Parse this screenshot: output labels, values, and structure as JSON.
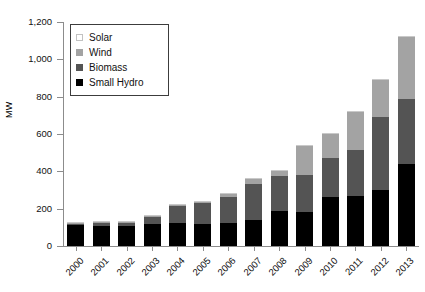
{
  "chart_data": {
    "type": "bar",
    "stacked": true,
    "title": "",
    "xlabel": "",
    "ylabel": "MW",
    "ylim": [
      0,
      1200
    ],
    "yticks": [
      0,
      200,
      400,
      600,
      800,
      1000,
      1200
    ],
    "ytick_labels": [
      "0",
      "200",
      "400",
      "600",
      "800",
      "1,000",
      "1,200"
    ],
    "grid": false,
    "legend_position": "top-left",
    "categories": [
      "2000",
      "2001",
      "2002",
      "2003",
      "2004",
      "2005",
      "2006",
      "2007",
      "2008",
      "2009",
      "2010",
      "2011",
      "2012",
      "2013"
    ],
    "series": [
      {
        "name": "Small Hydro",
        "color": "#000000",
        "values": [
          110,
          108,
          107,
          118,
          122,
          120,
          125,
          140,
          185,
          180,
          262,
          270,
          300,
          440
        ]
      },
      {
        "name": "Biomass",
        "color": "#545454",
        "values": [
          10,
          14,
          16,
          38,
          90,
          110,
          140,
          190,
          190,
          200,
          210,
          245,
          390,
          350
        ]
      },
      {
        "name": "Wind",
        "color": "#a3a3a3",
        "values": [
          3,
          4,
          4,
          5,
          6,
          8,
          15,
          30,
          28,
          155,
          130,
          205,
          200,
          330
        ]
      },
      {
        "name": "Solar",
        "color": "#fbfbfb",
        "values": [
          2,
          2,
          2,
          3,
          3,
          3,
          5,
          5,
          5,
          5,
          5,
          5,
          5,
          5
        ]
      }
    ],
    "totals": [
      125,
      128,
      129,
      164,
      221,
      241,
      285,
      365,
      408,
      540,
      607,
      725,
      895,
      1125
    ]
  },
  "legend": {
    "items": [
      {
        "label": "Solar",
        "swatch": "solar-swatch"
      },
      {
        "label": "Wind",
        "swatch": "wind-swatch"
      },
      {
        "label": "Biomass",
        "swatch": "biomass-swatch"
      },
      {
        "label": "Small Hydro",
        "swatch": "small-hydro-swatch"
      }
    ]
  }
}
